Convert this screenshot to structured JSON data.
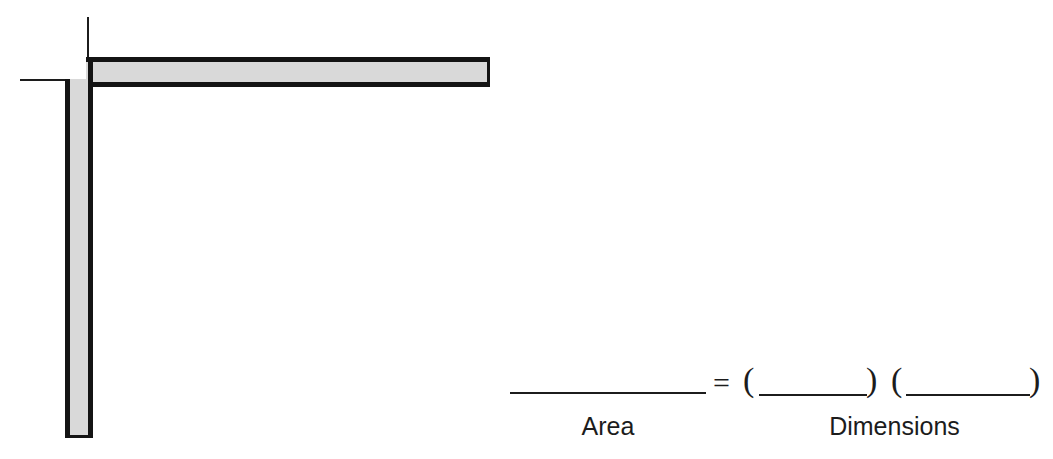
{
  "figure": {
    "shape_name": "l-shaped-bar",
    "fill_color": "#d9d9d9",
    "outline_color": "#141414",
    "parts": [
      {
        "name": "horizontal-bar",
        "orientation": "horizontal"
      },
      {
        "name": "vertical-bar",
        "orientation": "vertical"
      },
      {
        "name": "extension-line-horizontal",
        "orientation": "horizontal"
      },
      {
        "name": "extension-line-vertical",
        "orientation": "vertical"
      }
    ]
  },
  "equation": {
    "equals_sign": "=",
    "left_paren_1": "(",
    "right_paren_1": ")",
    "left_paren_2": "(",
    "right_paren_2": ")",
    "area_blank": "",
    "dimension_blank_1": "",
    "dimension_blank_2": "",
    "area_label": "Area",
    "dimensions_label": "Dimensions"
  }
}
